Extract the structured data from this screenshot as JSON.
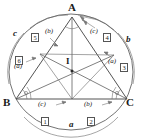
{
  "figure": {
    "kind": "geometry-diagram",
    "stroke_color": "#4a4a4a",
    "text_color": "#1a1a1a"
  },
  "vertices": [
    {
      "name": "A",
      "label": "A",
      "x": 72,
      "y": 11
    },
    {
      "name": "B",
      "label": "B",
      "x": 10,
      "y": 101
    },
    {
      "name": "C",
      "label": "C",
      "x": 131,
      "y": 101
    }
  ],
  "center": {
    "label": "I",
    "x": 69,
    "y": 62
  },
  "sides": [
    {
      "name": "side-c",
      "label": "c",
      "x": 16,
      "y": 33
    },
    {
      "name": "side-b",
      "label": "b",
      "x": 124,
      "y": 39
    },
    {
      "name": "side-a",
      "label": "a",
      "x": 69,
      "y": 124
    }
  ],
  "regions": [
    {
      "name": "region-1",
      "number": "1",
      "paren": "(c)",
      "paren_x": 40,
      "paren_y": 104,
      "num_x": 43,
      "num_y": 114
    },
    {
      "name": "region-2",
      "number": "2",
      "paren": "(b)",
      "paren_x": 86,
      "paren_y": 104,
      "num_x": 89,
      "num_y": 114
    },
    {
      "name": "region-3",
      "number": "3",
      "paren": "(a)",
      "paren_x": 111,
      "paren_y": 62,
      "num_x": 126,
      "num_y": 62
    },
    {
      "name": "region-4",
      "number": "4",
      "paren": "(c)",
      "paren_x": 93,
      "paren_y": 32,
      "num_x": 107,
      "num_y": 31
    },
    {
      "name": "region-5",
      "number": "5",
      "paren": "(b)",
      "paren_x": 46,
      "paren_y": 32,
      "num_x": 33,
      "num_y": 31
    },
    {
      "name": "region-6",
      "number": "6",
      "paren": "(a)",
      "paren_x": 16,
      "paren_y": 67,
      "num_x": 18,
      "num_y": 54
    }
  ]
}
